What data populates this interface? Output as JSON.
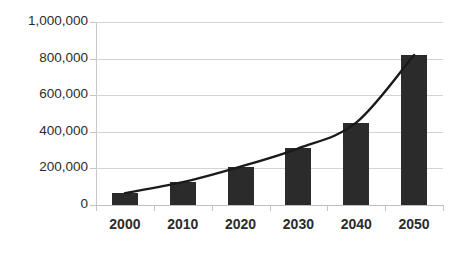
{
  "chart_data": {
    "type": "bar",
    "title": "",
    "xlabel": "",
    "ylabel": "",
    "categories": [
      "2000",
      "2010",
      "2020",
      "2030",
      "2040",
      "2050"
    ],
    "values": [
      65000,
      125000,
      210000,
      310000,
      450000,
      820000
    ],
    "series": [
      {
        "name": "bars",
        "type": "bar",
        "values": [
          65000,
          125000,
          210000,
          310000,
          450000,
          820000
        ]
      },
      {
        "name": "trend",
        "type": "line",
        "smooth": true,
        "values": [
          65000,
          125000,
          210000,
          310000,
          450000,
          820000
        ]
      }
    ],
    "ylim": [
      0,
      1000000
    ],
    "ytick_values": [
      0,
      200000,
      400000,
      600000,
      800000,
      1000000
    ],
    "ytick_labels": [
      "0",
      "200,000",
      "400,000",
      "600,000",
      "800,000",
      "1,000,000"
    ],
    "grid": true,
    "grid_axis": "y",
    "legend": false,
    "legend_position": "none",
    "colors": {
      "bar": "#2b2b2b",
      "line": "#1a1a1a",
      "gridline": "#d4d4d4",
      "axis": "#bfbfbf",
      "text": "#2c2c2c",
      "background": "#ffffff"
    }
  }
}
